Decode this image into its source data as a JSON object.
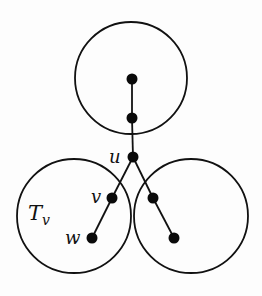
{
  "diagram": {
    "type": "tree-decomposition",
    "circles": [
      {
        "id": "top-subtree",
        "cx": 131,
        "cy": 78,
        "r": 56
      },
      {
        "id": "left-subtree",
        "cx": 74,
        "cy": 216,
        "r": 57,
        "label": "T_v"
      },
      {
        "id": "right-subtree",
        "cx": 191,
        "cy": 216,
        "r": 57
      }
    ],
    "nodes": [
      {
        "id": "top-root",
        "x": 132,
        "y": 79
      },
      {
        "id": "top-child",
        "x": 132,
        "y": 118
      },
      {
        "id": "u",
        "x": 133,
        "y": 157,
        "label": "u"
      },
      {
        "id": "v",
        "x": 112,
        "y": 198,
        "label": "v"
      },
      {
        "id": "w",
        "x": 92,
        "y": 238,
        "label": "w"
      },
      {
        "id": "right-a",
        "x": 153,
        "y": 198
      },
      {
        "id": "right-b",
        "x": 174,
        "y": 238
      }
    ],
    "edges": [
      [
        "top-root",
        "top-child"
      ],
      [
        "top-child",
        "u"
      ],
      [
        "u",
        "v"
      ],
      [
        "v",
        "w"
      ],
      [
        "u",
        "right-a"
      ],
      [
        "right-a",
        "right-b"
      ]
    ],
    "labels": {
      "u": "u",
      "v": "v",
      "w": "w",
      "subtree_main": "T",
      "subtree_sub": "v"
    }
  }
}
